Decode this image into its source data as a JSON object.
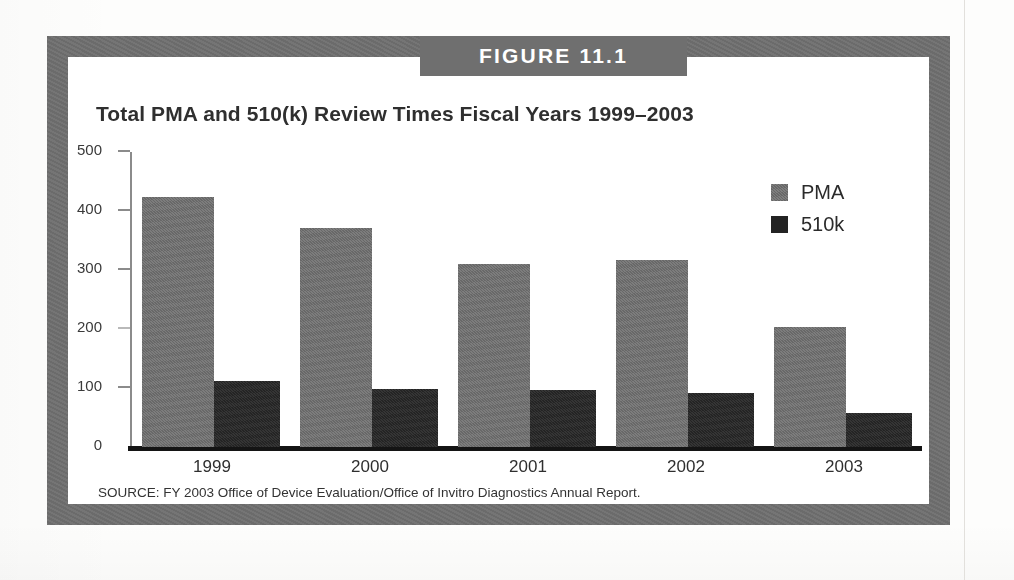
{
  "figure": {
    "banner_label": "FIGURE 11.1",
    "title": "Total PMA and 510(k) Review Times Fiscal Years 1999–2003",
    "source": "SOURCE: FY 2003 Office of Device Evaluation/Office of Invitro Diagnostics Annual Report."
  },
  "colors": {
    "frame": "#6f6f6f",
    "banner_bg": "#6f6f6f",
    "banner_text": "#ffffff",
    "pma": "#707070",
    "k510": "#262626",
    "axis": "#8b8b8b",
    "baseline": "#141414",
    "page": "#ffffff"
  },
  "chart_data": {
    "type": "bar",
    "title": "Total PMA and 510(k) Review Times Fiscal Years 1999–2003",
    "xlabel": "",
    "ylabel": "",
    "categories": [
      "1999",
      "2000",
      "2001",
      "2002",
      "2003"
    ],
    "series": [
      {
        "name": "PMA",
        "color": "#707070",
        "values": [
          423,
          372,
          311,
          317,
          203
        ]
      },
      {
        "name": "510k",
        "color": "#262626",
        "values": [
          112,
          98,
          96,
          91,
          58
        ]
      }
    ],
    "ylim": [
      0,
      500
    ],
    "yticks": [
      0,
      100,
      200,
      300,
      400,
      500
    ],
    "ytick_labels": [
      "0",
      "100",
      "200",
      "300",
      "400",
      "500"
    ],
    "grid": false,
    "legend_position": "top-right",
    "legend_entries": [
      "PMA",
      "510k"
    ]
  }
}
